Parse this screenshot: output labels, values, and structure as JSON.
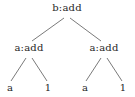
{
  "figure": {
    "type": "expression-tree-diagram",
    "background_color": "#ffffff",
    "edge_color": "#6b6b6b",
    "text_color": "#262626",
    "width": 135,
    "height": 97
  },
  "tree": {
    "root": {
      "id": "root",
      "label": "b:add",
      "x": 67,
      "y": 8
    },
    "level2": [
      {
        "id": "left-add",
        "label": "a:add",
        "x": 29,
        "y": 48
      },
      {
        "id": "right-add",
        "label": "a:add",
        "x": 104,
        "y": 48
      }
    ],
    "leaves": [
      {
        "id": "leaf-left-a",
        "label": "a",
        "x": 10,
        "y": 88
      },
      {
        "id": "leaf-left-1",
        "label": "1",
        "x": 48,
        "y": 88
      },
      {
        "id": "leaf-right-a",
        "label": "a",
        "x": 85,
        "y": 88
      },
      {
        "id": "leaf-right-1",
        "label": "1",
        "x": 123,
        "y": 88
      }
    ],
    "edges": [
      {
        "id": "edge-root-left",
        "x1": 64,
        "y1": 18,
        "x2": 32,
        "y2": 41
      },
      {
        "id": "edge-root-right",
        "x1": 70,
        "y1": 18,
        "x2": 101,
        "y2": 41
      },
      {
        "id": "edge-left-leaf-a",
        "x1": 26,
        "y1": 58,
        "x2": 11,
        "y2": 81
      },
      {
        "id": "edge-left-leaf-1",
        "x1": 32,
        "y1": 58,
        "x2": 47,
        "y2": 81
      },
      {
        "id": "edge-right-leaf-a",
        "x1": 101,
        "y1": 58,
        "x2": 86,
        "y2": 81
      },
      {
        "id": "edge-right-leaf-1",
        "x1": 107,
        "y1": 58,
        "x2": 122,
        "y2": 81
      }
    ]
  }
}
